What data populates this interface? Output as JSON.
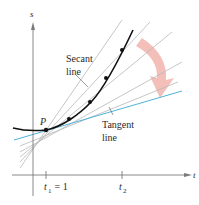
{
  "diagram": {
    "axes": {
      "vertical_label": "s",
      "horizontal_label": "t"
    },
    "point_label": "P",
    "ticks": {
      "t1_label": "t",
      "t1_sub": "1",
      "t1_eq": " = 1",
      "t2_label": "t",
      "t2_sub": "2"
    },
    "labels": {
      "secant_line1": "Secant",
      "secant_line2": "line",
      "tangent_line1": "Tangent",
      "tangent_line2": "line"
    },
    "colors": {
      "curve": "#111111",
      "secant": "#b5b5b5",
      "tangent": "#4fb3d9",
      "arrow": "#f2b8b0",
      "axis": "#7a7a7a"
    }
  }
}
